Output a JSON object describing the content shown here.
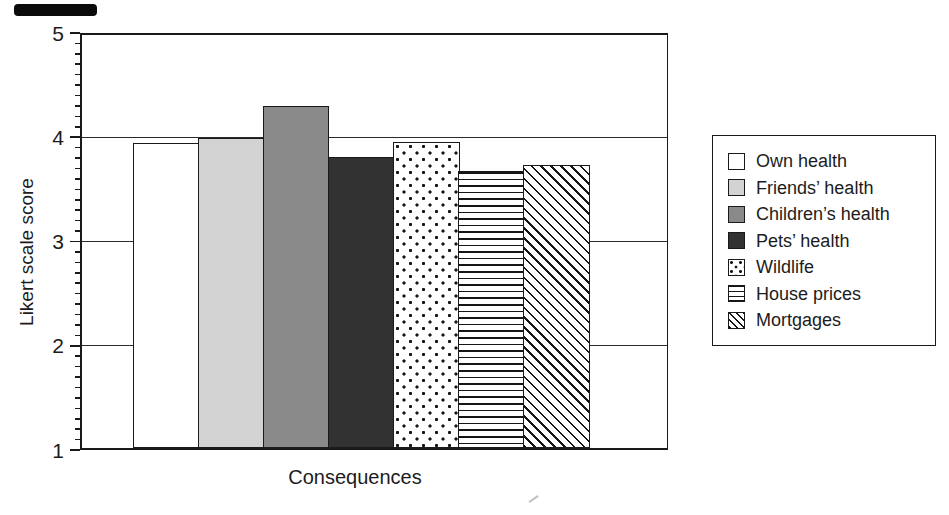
{
  "chart_data": {
    "type": "bar",
    "title": "",
    "xlabel": "Consequences",
    "ylabel": "Likert scale score",
    "ylim": [
      1,
      5
    ],
    "yticks": [
      "5",
      "4",
      "3",
      "2",
      "1"
    ],
    "ytick_values": [
      5,
      4,
      3,
      2,
      1
    ],
    "minor_tick_interval": 0.1,
    "gridline_values": [
      2,
      3,
      4
    ],
    "grid": "horizontal",
    "legend_position": "right",
    "categories": [
      "Own health",
      "Friends’ health",
      "Children’s health",
      "Pets’ health",
      "Wildlife",
      "House prices",
      "Mortgages"
    ],
    "series": [
      {
        "name": "Own health",
        "value": 3.95,
        "fill": "white"
      },
      {
        "name": "Friends’ health",
        "value": 4.0,
        "fill": "light-gray"
      },
      {
        "name": "Children’s health",
        "value": 4.3,
        "fill": "mid-gray"
      },
      {
        "name": "Pets’ health",
        "value": 3.82,
        "fill": "dark-gray"
      },
      {
        "name": "Wildlife",
        "value": 3.96,
        "fill": "dots"
      },
      {
        "name": "House prices",
        "value": 3.68,
        "fill": "h-lines"
      },
      {
        "name": "Mortgages",
        "value": 3.74,
        "fill": "diag-lines"
      }
    ]
  },
  "colors": {
    "axis": "#1a1a1a",
    "text": "#1c1c1c",
    "bar_white": "#ffffff",
    "bar_light_gray": "#d3d3d3",
    "bar_mid_gray": "#8a8a8a",
    "bar_dark_gray": "#323232",
    "background": "#ffffff"
  }
}
